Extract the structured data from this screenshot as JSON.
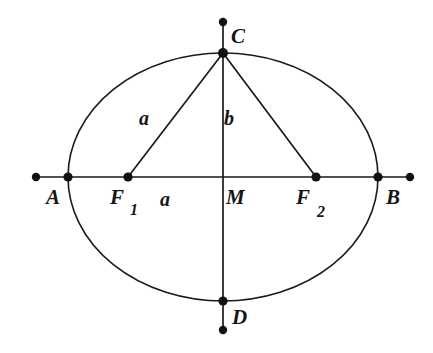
{
  "figure": {
    "background_color": "#ffffff",
    "stroke_color": "#1a1a1a",
    "width": 433,
    "height": 353
  },
  "geometry": {
    "center": {
      "x": 223,
      "y": 177
    },
    "semi_major_axis": 155,
    "semi_minor_axis": 124,
    "ellipse_left_x": 68,
    "ellipse_right_x": 378,
    "ellipse_top_y": 53,
    "ellipse_bottom_y": 301,
    "axis_line_left_end_x": 36,
    "axis_line_right_end_x": 410,
    "axis_line_top_end_y": 22,
    "axis_line_bottom_end_y": 330,
    "focus_left_x": 128,
    "focus_right_x": 316,
    "dot_radius": 4.6,
    "endpoint_dot_radius": 4.2,
    "curve_stroke_width": 1.6,
    "axis_stroke_width": 1.7,
    "chord_stroke_width": 1.7
  },
  "points": [
    {
      "id": "A",
      "label": "A",
      "x": 68,
      "y": 177,
      "label_x": 46,
      "label_y": 187,
      "kind": "vertex",
      "on_curve": true
    },
    {
      "id": "B",
      "label": "B",
      "x": 378,
      "y": 177,
      "label_x": 386,
      "label_y": 187,
      "kind": "vertex",
      "on_curve": true
    },
    {
      "id": "C",
      "label": "C",
      "x": 223,
      "y": 53,
      "label_x": 231,
      "label_y": 26,
      "kind": "co-vertex",
      "on_curve": true
    },
    {
      "id": "D",
      "label": "D",
      "x": 223,
      "y": 301,
      "label_x": 232,
      "label_y": 307,
      "kind": "co-vertex",
      "on_curve": true
    },
    {
      "id": "F1",
      "label": "F",
      "subscript": "1",
      "x": 128,
      "y": 177,
      "label_x": 110,
      "label_y": 187,
      "sub_x": 130,
      "sub_y": 202,
      "kind": "focus",
      "on_curve": false
    },
    {
      "id": "F2",
      "label": "F",
      "subscript": "2",
      "x": 316,
      "y": 177,
      "label_x": 296,
      "label_y": 187,
      "sub_x": 317,
      "sub_y": 204,
      "kind": "focus",
      "on_curve": false
    },
    {
      "id": "M",
      "label": "M",
      "x": 223,
      "y": 177,
      "label_x": 226,
      "label_y": 187,
      "kind": "center",
      "on_curve": false,
      "has_dot": false
    }
  ],
  "axis_endpoint_dots": [
    {
      "id": "left-axis-end",
      "x": 36,
      "y": 177
    },
    {
      "id": "right-axis-end",
      "x": 410,
      "y": 177
    },
    {
      "id": "top-axis-end",
      "x": 223,
      "y": 22
    },
    {
      "id": "bottom-axis-end",
      "x": 223,
      "y": 330
    }
  ],
  "segments": [
    {
      "id": "chord-C-F1",
      "from": "C",
      "to": "F1",
      "x1": 223,
      "y1": 53,
      "x2": 128,
      "y2": 177,
      "label": "a"
    },
    {
      "id": "chord-C-F2",
      "from": "C",
      "to": "F2",
      "x1": 223,
      "y1": 53,
      "x2": 316,
      "y2": 177,
      "label": null
    },
    {
      "id": "segment-C-M",
      "from": "C",
      "to": "M",
      "x1": 223,
      "y1": 53,
      "x2": 223,
      "y2": 177,
      "label": "b"
    },
    {
      "id": "segment-F1-M",
      "from": "F1",
      "to": "M",
      "x1": 128,
      "y1": 177,
      "x2": 223,
      "y2": 177,
      "label": "a"
    }
  ],
  "segment_labels": [
    {
      "id": "label-a-upper",
      "text": "a",
      "x": 139,
      "y": 108
    },
    {
      "id": "label-b",
      "text": "b",
      "x": 224,
      "y": 108
    },
    {
      "id": "label-a-lower",
      "text": "a",
      "x": 160,
      "y": 189
    }
  ]
}
